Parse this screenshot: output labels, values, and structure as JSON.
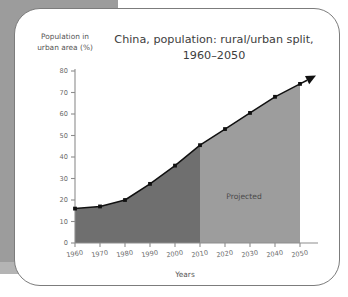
{
  "figure": {
    "background_color": "#ffffff",
    "card_border_color": "#7c7c7c",
    "band_color": "#9c9c9c"
  },
  "chart_data": {
    "type": "area",
    "title_line1": "China, population: rural/urban split,",
    "title_line2": "1960–2050",
    "ylabel_line1": "Population in",
    "ylabel_line2": "urban area (%)",
    "xlabel": "Years",
    "categories": [
      1960,
      1970,
      1980,
      1990,
      2000,
      2010,
      2020,
      2030,
      2040,
      2050
    ],
    "values": [
      16,
      17,
      20,
      27.5,
      36,
      45.5,
      53,
      60.5,
      68,
      74
    ],
    "xtick_labels": [
      "1960",
      "1970",
      "1980",
      "1990",
      "2000",
      "2010",
      "2020",
      "2030",
      "2040",
      "2050"
    ],
    "ytick_labels": [
      "0",
      "10",
      "20",
      "30",
      "40",
      "50",
      "60",
      "70",
      "80"
    ],
    "ytick_values": [
      0,
      10,
      20,
      30,
      40,
      50,
      60,
      70,
      80
    ],
    "ylim": [
      0,
      80
    ],
    "xlim": [
      1960,
      2050
    ],
    "grid": false,
    "legend": "none",
    "annotation": "Projected",
    "annotation_start_year": 2010,
    "historical_fill_color": "#6f6f6f",
    "projected_fill_color": "#9d9d9d",
    "line_color": "#111111",
    "marker_color": "#111111",
    "has_arrow_head": true
  }
}
